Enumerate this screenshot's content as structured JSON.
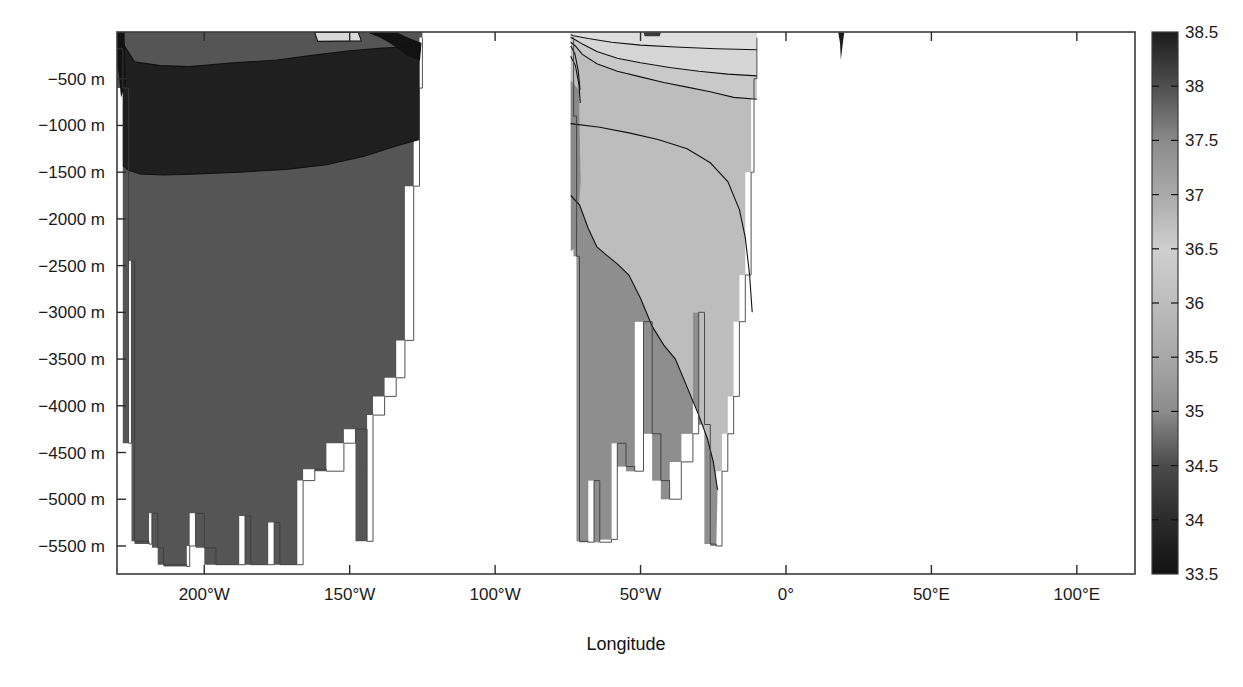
{
  "chart_data": {
    "type": "heatmap",
    "title": "",
    "subtitle": "",
    "xlabel": "Longitude",
    "ylabel": "",
    "colorbar_label": "",
    "xlim": [
      -230,
      120
    ],
    "ylim": [
      -5800,
      0
    ],
    "grid": false,
    "legend_position": "right-colorbar",
    "xticks": [
      -200,
      -150,
      -100,
      -50,
      0,
      50,
      100
    ],
    "xticklabels": [
      "200°W",
      "150°W",
      "100°W",
      "50°W",
      "0°",
      "50°E",
      "100°E"
    ],
    "yticks": [
      -500,
      -1000,
      -1500,
      -2000,
      -2500,
      -3000,
      -3500,
      -4000,
      -4500,
      -5000,
      -5500
    ],
    "yticklabels": [
      "−500 m",
      "−1000 m",
      "−1500 m",
      "−2000 m",
      "−2500 m",
      "−3000 m",
      "−3500 m",
      "−4000 m",
      "−4500 m",
      "−5000 m",
      "−5500 m"
    ],
    "colorbar": {
      "vmin": 33.5,
      "vmax": 38.5,
      "ticks": [
        33.5,
        34,
        34.5,
        35,
        35.5,
        36,
        36.5,
        37,
        37.5,
        38,
        38.5
      ],
      "ticklabels": [
        "33.5",
        "34",
        "34.5",
        "35",
        "35.5",
        "36",
        "36.5",
        "37",
        "37.5",
        "38",
        "38.5"
      ],
      "stops": [
        {
          "v": 33.5,
          "color": "#121212"
        },
        {
          "v": 34.0,
          "color": "#2b2b2b"
        },
        {
          "v": 34.5,
          "color": "#4a4a4a"
        },
        {
          "v": 35.0,
          "color": "#8c8c8c"
        },
        {
          "v": 35.5,
          "color": "#a8a8a8"
        },
        {
          "v": 36.0,
          "color": "#bdbdbd"
        },
        {
          "v": 36.5,
          "color": "#cfcfcf"
        },
        {
          "v": 37.0,
          "color": "#aaaaaa"
        },
        {
          "v": 37.5,
          "color": "#8a8a8a"
        },
        {
          "v": 38.0,
          "color": "#4e4e4e"
        },
        {
          "v": 38.5,
          "color": "#1c1c1c"
        }
      ]
    },
    "fill_levels": [
      {
        "value": 33.6,
        "color": "#141414",
        "label": "33.5–33.75"
      },
      {
        "value": 34.1,
        "color": "#1f1f1f",
        "label": "34–34.25"
      },
      {
        "value": 34.5,
        "color": "#3c3c3c",
        "label": "34.5"
      },
      {
        "value": 34.8,
        "color": "#6e6e6e",
        "label": "34.75"
      },
      {
        "value": 35.1,
        "color": "#8e8e8e",
        "label": "35"
      },
      {
        "value": 35.4,
        "color": "#a2a2a2",
        "label": "35.25"
      },
      {
        "value": 35.7,
        "color": "#b4b4b4",
        "label": "35.5"
      },
      {
        "value": 36.1,
        "color": "#c6c6c6",
        "label": "36"
      },
      {
        "value": 36.5,
        "color": "#d6d6d6",
        "label": "36.5"
      }
    ],
    "regions": [
      {
        "name": "pacific-deep-water",
        "salinity": 34.7,
        "color": "#555555",
        "comment": "Pacific basin bulk, salinity ~34.6-34.8"
      },
      {
        "name": "pacific-upper-low-salinity",
        "salinity": 34.1,
        "color": "#1f1f1f",
        "comment": "North Pacific intermediate low-salinity tongue, 200-1500 m"
      },
      {
        "name": "pacific-surface-fresh-core",
        "salinity": 33.6,
        "color": "#121212",
        "comment": "Very fresh subarctic surface core near eastern boundary"
      },
      {
        "name": "atlantic-deep-water",
        "salinity": 34.9,
        "color": "#8e8e8e",
        "comment": "North Atlantic Deep Water, high salinity below 2500 m is slightly fresher"
      },
      {
        "name": "atlantic-mid-water",
        "salinity": 35.4,
        "color": "#bdbdbd",
        "comment": "Atlantic 500-2500 m saline core"
      },
      {
        "name": "atlantic-surface-saline",
        "salinity": 36.2,
        "color": "#d4d4d4",
        "comment": "Atlantic near-surface subtropical saline layer"
      },
      {
        "name": "mediterranean-sliver",
        "salinity": 38.4,
        "color": "#1c1c1c",
        "comment": "Narrow very-high salinity column near 20°E"
      }
    ],
    "profiles": {
      "pacific_bathymetry": [
        [
          -232,
          -180
        ],
        [
          -228,
          -600
        ],
        [
          -226,
          -4400
        ],
        [
          -225,
          -2450
        ],
        [
          -224,
          -5450
        ],
        [
          -219,
          -5480
        ],
        [
          -218,
          -5150
        ],
        [
          -216,
          -5520
        ],
        [
          -214,
          -5700
        ],
        [
          -206,
          -5720
        ],
        [
          -205,
          -5500
        ],
        [
          -203,
          -5150
        ],
        [
          -200,
          -5520
        ],
        [
          -196,
          -5700
        ],
        [
          -188,
          -5700
        ],
        [
          -186,
          -5180
        ],
        [
          -184,
          -5700
        ],
        [
          -178,
          -5700
        ],
        [
          -176,
          -5250
        ],
        [
          -174,
          -5700
        ],
        [
          -168,
          -5700
        ],
        [
          -166,
          -4800
        ],
        [
          -162,
          -4680
        ],
        [
          -158,
          -4700
        ],
        [
          -152,
          -4400
        ],
        [
          -148,
          -4250
        ],
        [
          -144,
          -5450
        ],
        [
          -142,
          -4100
        ],
        [
          -138,
          -3900
        ],
        [
          -134,
          -3700
        ],
        [
          -131,
          -3300
        ],
        [
          -128,
          -1650
        ],
        [
          -126,
          -600
        ],
        [
          -125,
          -60
        ]
      ],
      "atlantic_bathymetry": [
        [
          -74,
          -60
        ],
        [
          -73,
          -900
        ],
        [
          -72,
          -2400
        ],
        [
          -71,
          -5450
        ],
        [
          -68,
          -5460
        ],
        [
          -66,
          -4800
        ],
        [
          -64,
          -5460
        ],
        [
          -60,
          -5430
        ],
        [
          -58,
          -4400
        ],
        [
          -55,
          -4650
        ],
        [
          -52,
          -4700
        ],
        [
          -49,
          -3100
        ],
        [
          -46,
          -4300
        ],
        [
          -43,
          -4800
        ],
        [
          -40,
          -5000
        ],
        [
          -36,
          -4600
        ],
        [
          -32,
          -4300
        ],
        [
          -30,
          -3000
        ],
        [
          -28,
          -4200
        ],
        [
          -26,
          -5480
        ],
        [
          -24,
          -5500
        ],
        [
          -22,
          -4700
        ],
        [
          -20,
          -4300
        ],
        [
          -18,
          -3900
        ],
        [
          -16,
          -3100
        ],
        [
          -14,
          -2600
        ],
        [
          -12,
          -1500
        ],
        [
          -11,
          -500
        ],
        [
          -10,
          -60
        ]
      ]
    }
  },
  "axes": {
    "x_axis_title": "Longitude",
    "y_axis_title": ""
  },
  "icons": {
    "none": ""
  }
}
